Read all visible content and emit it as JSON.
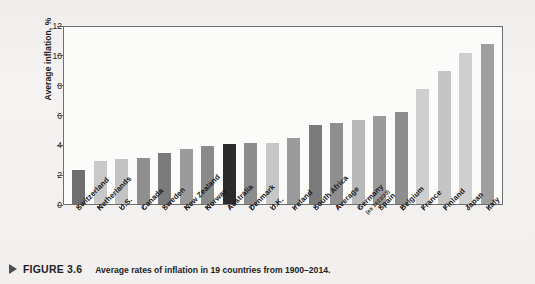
{
  "chart_data": {
    "type": "bar",
    "title": "",
    "xlabel": "",
    "ylabel": "Average inflation, %",
    "ylim": [
      0,
      12
    ],
    "yticks": [
      0,
      2,
      4,
      6,
      8,
      10,
      12
    ],
    "grid": false,
    "legend": "none",
    "categories": [
      "Switzerland",
      "Netherlands",
      "U.S.",
      "Canada",
      "Sweden",
      "New Zealand",
      "Norway",
      "Australia",
      "Denmark",
      "U.K.",
      "Ireland",
      "South Africa",
      "Average",
      "Germany",
      "Spain",
      "Belgium",
      "France",
      "Finland",
      "Japan",
      "Italy"
    ],
    "category_sublabels": [
      "",
      "",
      "",
      "",
      "",
      "",
      "",
      "",
      "",
      "",
      "",
      "",
      "",
      "(ex 1922/23)",
      "",
      "",
      "",
      "",
      "",
      ""
    ],
    "values": [
      2.3,
      2.9,
      3.0,
      3.1,
      3.4,
      3.7,
      3.9,
      4.0,
      4.1,
      4.1,
      4.4,
      5.3,
      5.4,
      5.6,
      5.9,
      6.2,
      7.7,
      8.9,
      10.1,
      10.7
    ],
    "bar_colors": [
      "#6e6e6e",
      "#c9c9c9",
      "#c2c2c2",
      "#8f8f8f",
      "#7b7b7b",
      "#9b9b9b",
      "#8a8a8a",
      "#2b2b2b",
      "#8d8d8d",
      "#c6c6c6",
      "#9a9a9a",
      "#7a7a7a",
      "#8f8f8f",
      "#b8b8b8",
      "#9a9a9a",
      "#8d8d8d",
      "#cfcfcf",
      "#c4c4c4",
      "#cfcfcf",
      "#9f9f9f"
    ]
  },
  "caption": {
    "figure_number": "FIGURE 3.6",
    "text": "Average rates of inflation in 19 countries from 1900–2014."
  }
}
